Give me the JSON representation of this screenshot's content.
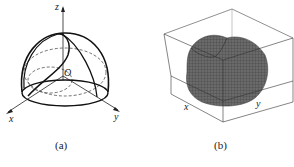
{
  "figure": {
    "panel_a": {
      "caption": "(a)",
      "axes": {
        "x": "x",
        "y": "y",
        "z": "z",
        "origin": "O"
      },
      "description": "Hemisphere with intersecting cylinder curves, dashed hidden lines"
    },
    "panel_b": {
      "caption": "(b)",
      "axes": {
        "x": "x",
        "y": "y"
      },
      "description": "3D mesh surface plot inside bounding box",
      "surface_color": "#5a5a5a"
    }
  }
}
